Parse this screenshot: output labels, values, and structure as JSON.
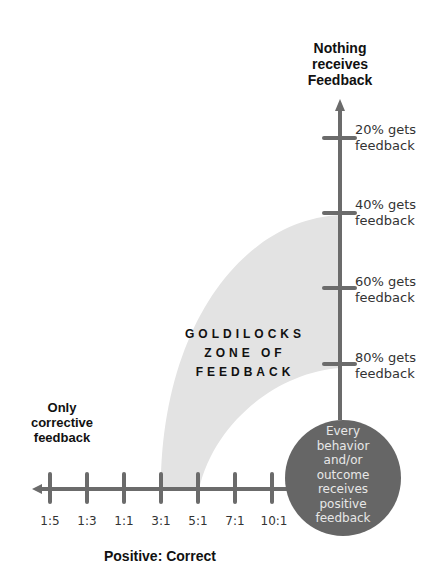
{
  "colors": {
    "axis": "#6b6b6b",
    "zone": "#e3e3e3",
    "circle": "#666666",
    "circle_text": "#eeeeee",
    "text": "#222222"
  },
  "top_label": [
    "Nothing",
    "receives",
    "Feedback"
  ],
  "left_label": [
    "Only",
    "corrective",
    "feedback"
  ],
  "x_axis_title": "Positive: Correct",
  "x_ticks": [
    "1:5",
    "1:3",
    "1:1",
    "3:1",
    "5:1",
    "7:1",
    "10:1"
  ],
  "y_ticks": [
    {
      "line1": "20% gets",
      "line2": "feedback"
    },
    {
      "line1": "40% gets",
      "line2": "feedback"
    },
    {
      "line1": "60% gets",
      "line2": "feedback"
    },
    {
      "line1": "80% gets",
      "line2": "feedback"
    }
  ],
  "zone_label": [
    "GOLDILOCKS",
    "ZONE OF",
    "FEEDBACK"
  ],
  "circle_text": [
    "Every",
    "behavior",
    "and/or",
    "outcome",
    "receives",
    "positive",
    "feedback"
  ]
}
